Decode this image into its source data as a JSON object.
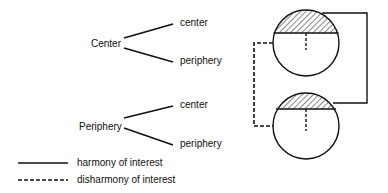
{
  "tree": {
    "root_center": "Center",
    "root_periphery": "Periphery",
    "center_children": [
      "center",
      "periphery"
    ],
    "periphery_children": [
      "center",
      "periphery"
    ]
  },
  "legend": {
    "solid_label": "harmony of interest",
    "dashed_label": "disharmony of interest"
  },
  "colors": {
    "ink": "#111111",
    "background": "#ffffff"
  }
}
